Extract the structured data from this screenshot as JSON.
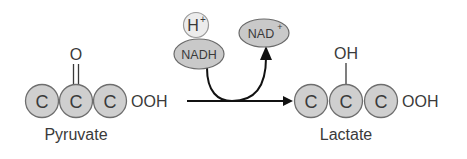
{
  "diagram": {
    "type": "chemical-reaction",
    "reactant": {
      "name": "Pyruvate",
      "atoms": [
        "C",
        "C",
        "C"
      ],
      "tail": "OOH",
      "substituent": "O",
      "substituent_bond": "double"
    },
    "product": {
      "name": "Lactate",
      "atoms": [
        "C",
        "C",
        "C"
      ],
      "tail": "OOH",
      "substituent": "OH",
      "substituent_bond": "single"
    },
    "cofactors": {
      "proton": "H",
      "proton_charge": "+",
      "reduced": "NADH",
      "oxidized": "NAD",
      "oxidized_charge": "+"
    },
    "colors": {
      "atom_fill": "#cfcfcf",
      "atom_stroke": "#6e6e6e",
      "text": "#3a3a3a",
      "arrow": "#111111"
    }
  }
}
